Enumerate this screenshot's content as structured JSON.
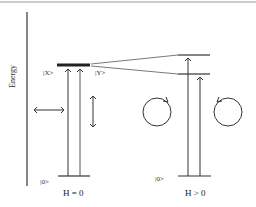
{
  "diagram": {
    "y_axis_label": "Energy",
    "left_panel": {
      "state_excited_x": "|X>",
      "state_excited_y": "|Y>",
      "state_ground": "|0>",
      "caption": "H = 0"
    },
    "right_panel": {
      "state_ground": "|0>",
      "caption": "H > 0"
    },
    "colors": {
      "line": "#333333",
      "frame": "#999999"
    }
  }
}
